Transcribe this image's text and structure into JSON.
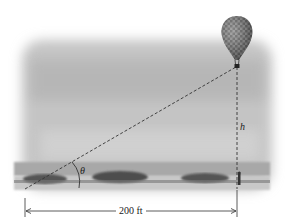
{
  "diagram": {
    "labels": {
      "distance": "200 ft",
      "height": "h",
      "angle": "θ"
    },
    "colors": {
      "sky": "#bdbdbd",
      "ground": "#9a9a9a",
      "trees": "#555555",
      "lines": "#333333",
      "balloon": "#7a7a7a"
    },
    "elements": [
      {
        "name": "balloon",
        "description": "checkered hot-air balloon at top right"
      },
      {
        "name": "line-of-sight",
        "description": "dashed line from observer to balloon basket"
      },
      {
        "name": "vertical-height",
        "description": "dashed vertical line from balloon to ground, labeled h"
      },
      {
        "name": "angle-arc",
        "description": "arc marking angle of elevation θ"
      },
      {
        "name": "distance-dimension",
        "description": "horizontal dimension arrow labeled 200 ft"
      },
      {
        "name": "person",
        "description": "small figure standing under balloon"
      }
    ]
  }
}
